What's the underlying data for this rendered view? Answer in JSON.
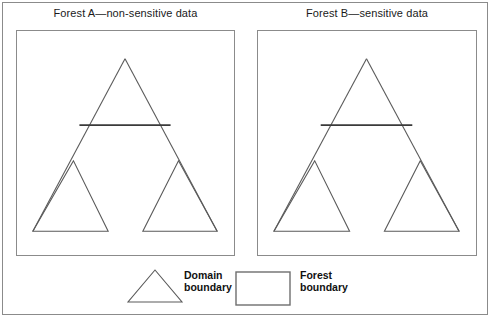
{
  "figure": {
    "type": "diagram",
    "background_color": "#ffffff",
    "frame_color": "#8b8b8b",
    "line_color": "#5a5a5a",
    "emphasis_line_color": "#3a3a3a"
  },
  "panels": [
    {
      "id": "forest-a",
      "title": "Forest A—non-sensitive data",
      "shapes": {
        "root_triangle": {
          "apex": [
            109,
            28
          ],
          "left_base": [
            16,
            202
          ],
          "right_base": [
            202,
            202
          ]
        },
        "trust_link": {
          "x1": 63,
          "y1": 95,
          "x2": 155,
          "y2": 95
        },
        "child_left": {
          "apex": [
            57,
            131
          ],
          "left_base": [
            16,
            202
          ],
          "right_base": [
            92,
            202
          ]
        },
        "child_right": {
          "apex": [
            163,
            131
          ],
          "left_base": [
            127,
            202
          ],
          "right_base": [
            202,
            202
          ]
        }
      }
    },
    {
      "id": "forest-b",
      "title": "Forest B—sensitive data",
      "shapes": {
        "root_triangle": {
          "apex": [
            109,
            28
          ],
          "left_base": [
            16,
            202
          ],
          "right_base": [
            202,
            202
          ]
        },
        "trust_link": {
          "x1": 63,
          "y1": 95,
          "x2": 155,
          "y2": 95
        },
        "child_left": {
          "apex": [
            57,
            131
          ],
          "left_base": [
            16,
            202
          ],
          "right_base": [
            92,
            202
          ]
        },
        "child_right": {
          "apex": [
            163,
            131
          ],
          "left_base": [
            127,
            202
          ],
          "right_base": [
            202,
            202
          ]
        }
      }
    }
  ],
  "legend": {
    "items": [
      {
        "symbol": "triangle",
        "label_line1": "Domain",
        "label_line2": "boundary"
      },
      {
        "symbol": "rectangle",
        "label_line1": "Forest",
        "label_line2": "boundary"
      }
    ]
  }
}
